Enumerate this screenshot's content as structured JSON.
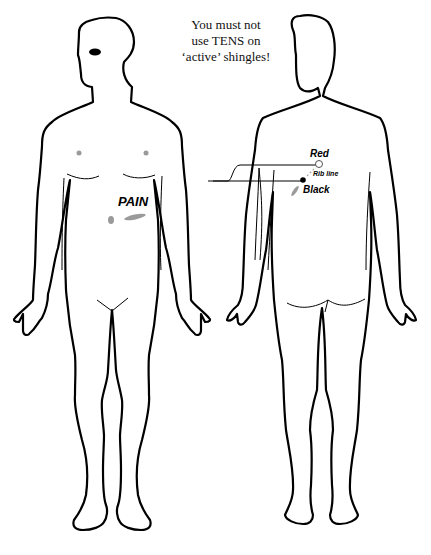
{
  "warning": {
    "line1": "You must not",
    "line2": "use TENS on",
    "line3": "‘active’ shingles!"
  },
  "front_view": {
    "pain_label": "PAIN"
  },
  "back_view": {
    "red_label": "Red",
    "black_label": "Black",
    "rib_label": "Rib line"
  },
  "colors": {
    "outline": "#000000",
    "marker_gray": "#9a9a9a",
    "background": "#ffffff"
  }
}
